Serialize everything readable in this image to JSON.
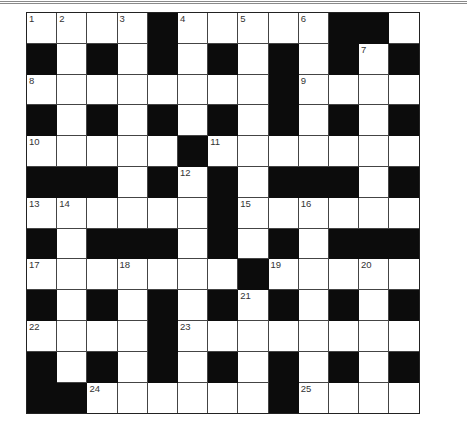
{
  "crossword": {
    "rows": 13,
    "cols": 13,
    "layout": [
      "....#.....##.",
      "#.#.#.#.#.#.#",
      "........#....",
      "#.#.#.#.#.#.#",
      ".....#.......",
      "###.#.#.###.#",
      "......#......",
      "#.###.#.#.###",
      ".......#.....",
      "#.#.#.#.#.#.#",
      "....#........",
      "#.#.#.#.#.#.#",
      "##......#...."
    ],
    "numbers": [
      {
        "r": 0,
        "c": 0,
        "n": "1"
      },
      {
        "r": 0,
        "c": 1,
        "n": "2"
      },
      {
        "r": 0,
        "c": 3,
        "n": "3"
      },
      {
        "r": 0,
        "c": 5,
        "n": "4"
      },
      {
        "r": 0,
        "c": 7,
        "n": "5"
      },
      {
        "r": 0,
        "c": 9,
        "n": "6"
      },
      {
        "r": 1,
        "c": 11,
        "n": "7"
      },
      {
        "r": 2,
        "c": 0,
        "n": "8"
      },
      {
        "r": 2,
        "c": 9,
        "n": "9"
      },
      {
        "r": 4,
        "c": 0,
        "n": "10"
      },
      {
        "r": 4,
        "c": 6,
        "n": "11"
      },
      {
        "r": 5,
        "c": 5,
        "n": "12"
      },
      {
        "r": 6,
        "c": 0,
        "n": "13"
      },
      {
        "r": 6,
        "c": 1,
        "n": "14"
      },
      {
        "r": 6,
        "c": 7,
        "n": "15"
      },
      {
        "r": 6,
        "c": 9,
        "n": "16"
      },
      {
        "r": 8,
        "c": 0,
        "n": "17"
      },
      {
        "r": 8,
        "c": 3,
        "n": "18"
      },
      {
        "r": 8,
        "c": 8,
        "n": "19"
      },
      {
        "r": 8,
        "c": 11,
        "n": "20"
      },
      {
        "r": 9,
        "c": 7,
        "n": "21"
      },
      {
        "r": 10,
        "c": 0,
        "n": "22"
      },
      {
        "r": 10,
        "c": 5,
        "n": "23"
      },
      {
        "r": 12,
        "c": 2,
        "n": "24"
      },
      {
        "r": 12,
        "c": 9,
        "n": "25"
      }
    ]
  }
}
